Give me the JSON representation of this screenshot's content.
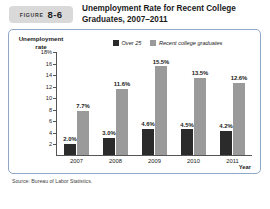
{
  "figure": {
    "label_word": "FIGURE",
    "number": "8-6",
    "title": "Unemployment Rate for Recent College Graduates, 2007–2011"
  },
  "source_note": "Source: Bureau of Labor Statistics.",
  "colors": {
    "series_over25": "#2b2b2b",
    "series_recent_grads": "#9a9a9a",
    "panel_border": "#8fa8c8",
    "badge_bg": "#d9d9d9",
    "axis": "#555555"
  },
  "chart_data": {
    "type": "bar",
    "title": "Unemployment Rate for Recent College Graduates, 2007–2011",
    "categories": [
      "2007",
      "2008",
      "2009",
      "2010",
      "2011"
    ],
    "series": [
      {
        "name": "Over 25",
        "values": [
          2.0,
          3.0,
          4.6,
          4.5,
          4.2
        ],
        "labels": [
          "2.0%",
          "3.0%",
          "4.6%",
          "4.5%",
          "4.2%"
        ],
        "color": "#2b2b2b"
      },
      {
        "name": "Recent college graduates",
        "values": [
          7.7,
          11.6,
          15.5,
          13.5,
          12.6
        ],
        "labels": [
          "7.7%",
          "11.6%",
          "15.5%",
          "13.5%",
          "12.6%"
        ],
        "color": "#9a9a9a"
      }
    ],
    "xlabel": "Year",
    "ylabel": "Unemployment rate",
    "ylim": [
      0,
      18
    ],
    "yticks": [
      "2",
      "4",
      "6",
      "8",
      "10",
      "12",
      "14",
      "16",
      "18%"
    ],
    "ytick_values": [
      2,
      4,
      6,
      8,
      10,
      12,
      14,
      16,
      18
    ],
    "grid": false,
    "legend_position": "top-right"
  }
}
